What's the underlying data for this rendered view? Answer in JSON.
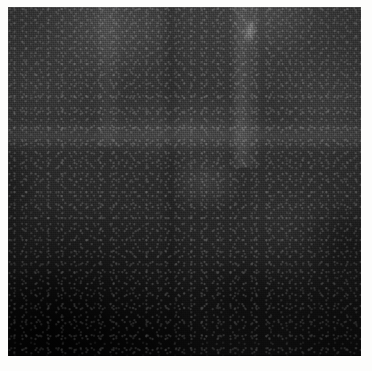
{
  "canvas": {
    "width": 372,
    "height": 371,
    "background_color": "#fdfdfc",
    "alt_text": ""
  },
  "image": {
    "kind": "photographic-texture-plate",
    "caption": "",
    "plate": {
      "left": 8,
      "top": 7,
      "width": 353,
      "height": 349,
      "base_color": "#262626",
      "lightest_color": "#3e3e3e",
      "darkest_color": "#0d0d0d",
      "description": "Uniform dark grainy surface, scanned halftone appearance",
      "gradient_direction": "light at top and top-right, darkest toward bottom-left corner"
    },
    "features": [
      {
        "name": "light-horizontal-band",
        "approx_y": 128,
        "note": "faint lighter seam running full width"
      },
      {
        "name": "light-vertical-streak-right",
        "approx_x": 246,
        "note": "pale vertical streak in upper half"
      },
      {
        "name": "light-vertical-streak-left",
        "approx_x": 110,
        "note": "soft pale vertical streak near top-left"
      },
      {
        "name": "bright-flare",
        "approx_x": 248,
        "approx_y": 18,
        "note": "small bright highlight near top-right"
      },
      {
        "name": "light-blob-center",
        "approx_x": 200,
        "approx_y": 180,
        "note": "subtle lighter patch toward the center"
      },
      {
        "name": "dark-corner",
        "approx_x": 45,
        "approx_y": 310,
        "note": "near-black region in the lower-left corner"
      }
    ],
    "text_content": [],
    "annotations": []
  }
}
